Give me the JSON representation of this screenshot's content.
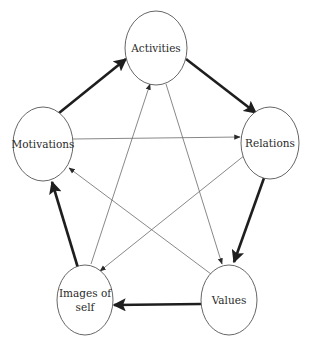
{
  "diagram": {
    "title": "",
    "nodes": [
      {
        "id": "activities",
        "label_lines": [
          "Activities"
        ]
      },
      {
        "id": "relations",
        "label_lines": [
          "Relations"
        ]
      },
      {
        "id": "values",
        "label_lines": [
          "Values"
        ]
      },
      {
        "id": "images",
        "label_lines": [
          "Images of",
          "self"
        ]
      },
      {
        "id": "motivations",
        "label_lines": [
          "Motivations"
        ]
      }
    ],
    "edges": [
      {
        "from": "motivations",
        "to": "activities",
        "weight": "thick"
      },
      {
        "from": "activities",
        "to": "relations",
        "weight": "thick"
      },
      {
        "from": "relations",
        "to": "values",
        "weight": "thick"
      },
      {
        "from": "values",
        "to": "images",
        "weight": "thick"
      },
      {
        "from": "images",
        "to": "motivations",
        "weight": "thick"
      },
      {
        "from": "motivations",
        "to": "relations",
        "weight": "thin"
      },
      {
        "from": "activities",
        "to": "values",
        "weight": "thin"
      },
      {
        "from": "relations",
        "to": "images",
        "weight": "thin"
      },
      {
        "from": "values",
        "to": "motivations",
        "weight": "thin"
      },
      {
        "from": "images",
        "to": "activities",
        "weight": "thin"
      }
    ]
  }
}
